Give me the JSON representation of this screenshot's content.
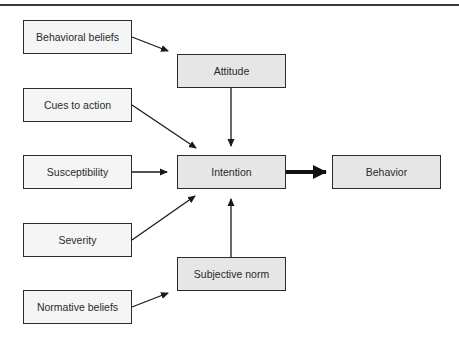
{
  "diagram": {
    "type": "flowchart",
    "nodes": {
      "behavioral_beliefs": "Behavioral beliefs",
      "cues_to_action": "Cues to action",
      "susceptibility": "Susceptibility",
      "severity": "Severity",
      "normative_beliefs": "Normative beliefs",
      "attitude": "Attitude",
      "intention": "Intention",
      "subjective_norm": "Subjective norm",
      "behavior": "Behavior"
    },
    "edges": [
      {
        "from": "Behavioral beliefs",
        "to": "Attitude"
      },
      {
        "from": "Attitude",
        "to": "Intention"
      },
      {
        "from": "Cues to action",
        "to": "Intention"
      },
      {
        "from": "Susceptibility",
        "to": "Intention"
      },
      {
        "from": "Severity",
        "to": "Intention"
      },
      {
        "from": "Subjective norm",
        "to": "Intention"
      },
      {
        "from": "Normative beliefs",
        "to": "Subjective norm"
      },
      {
        "from": "Intention",
        "to": "Behavior",
        "style": "bold"
      }
    ],
    "colors": {
      "input_box_fill": "#f5f5f5",
      "construct_box_fill": "#e6e6e6",
      "stroke": "#2b2b2b"
    }
  }
}
